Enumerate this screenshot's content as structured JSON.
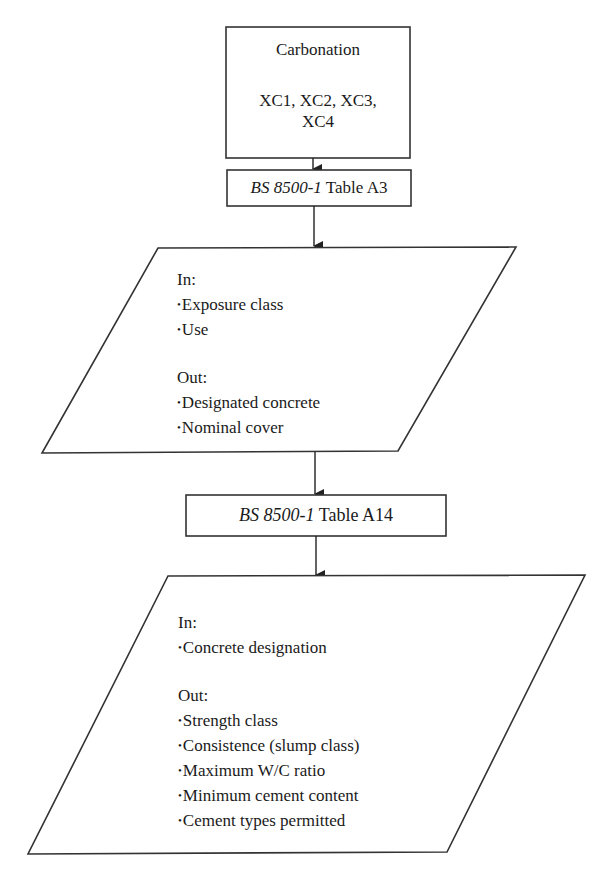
{
  "flowchart": {
    "start_box": {
      "title": "Carbonation",
      "classes_line1": "XC1, XC2, XC3,",
      "classes_line2": "XC4"
    },
    "table_a3_box": {
      "standard": "BS 8500-1",
      "table": "Table A3"
    },
    "process_a3": {
      "in_label": "In:",
      "in_items": [
        "Exposure class",
        "Use"
      ],
      "out_label": "Out:",
      "out_items": [
        "Designated concrete",
        "Nominal cover"
      ]
    },
    "table_a14_box": {
      "standard": "BS 8500-1",
      "table": "Table A14"
    },
    "process_a14": {
      "in_label": "In:",
      "in_items": [
        "Concrete designation"
      ],
      "out_label": "Out:",
      "out_items": [
        "Strength class",
        "Consistence (slump class)",
        "Maximum W/C ratio",
        "Minimum cement content",
        "Cement types permitted"
      ]
    }
  },
  "colors": {
    "stroke": "#333333",
    "background": "#ffffff",
    "text": "#1a1a1a"
  }
}
